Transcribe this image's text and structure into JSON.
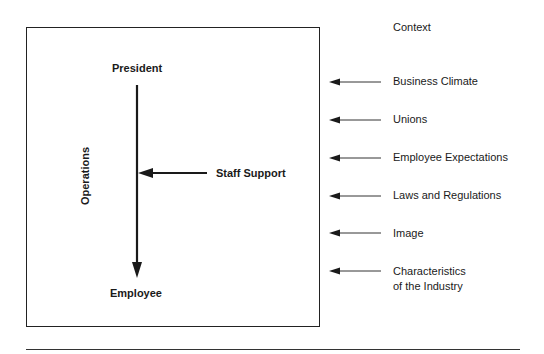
{
  "diagram": {
    "box": {
      "top_label": "President",
      "bottom_label": "Employee",
      "side_label": "Operations",
      "staff_label": "Staff Support"
    },
    "context": {
      "heading": "Context",
      "factors": [
        {
          "label": "Business Climate"
        },
        {
          "label": "Unions"
        },
        {
          "label": "Employee Expectations"
        },
        {
          "label": "Laws and Regulations"
        },
        {
          "label": "Image"
        },
        {
          "label_line1": "Characteristics",
          "label_line2": "of the Industry"
        }
      ]
    },
    "colors": {
      "line": "#1a1a1a",
      "background": "#ffffff"
    }
  }
}
